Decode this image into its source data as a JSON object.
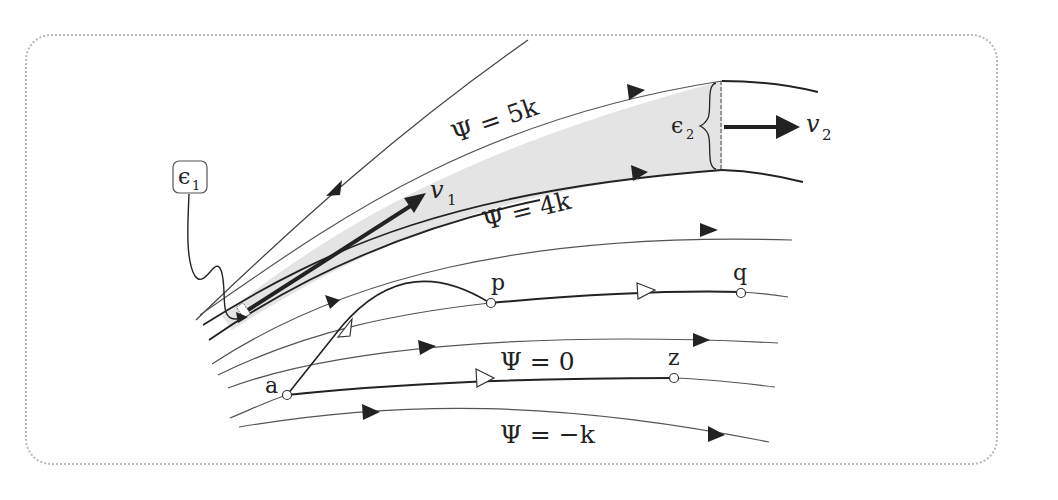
{
  "diagram": {
    "colors": {
      "line": "#3a3a3a",
      "tube_fill": "#e6e6e6",
      "frame": "#b8b8b8"
    },
    "streamline_labels": {
      "psi_5k": "Ψ = 5k",
      "psi_4k": "Ψ = 4k",
      "psi_0": "Ψ = 0",
      "psi_neg_k": "Ψ = −k"
    },
    "points": {
      "a": "a",
      "p": "p",
      "q": "q",
      "z": "z"
    },
    "velocity_labels": {
      "v1": "v",
      "v1_sub": "1",
      "v2": "v",
      "v2_sub": "2"
    },
    "width_labels": {
      "e1": "ϵ",
      "e1_sub": "1",
      "e2": "ϵ",
      "e2_sub": "2"
    }
  }
}
